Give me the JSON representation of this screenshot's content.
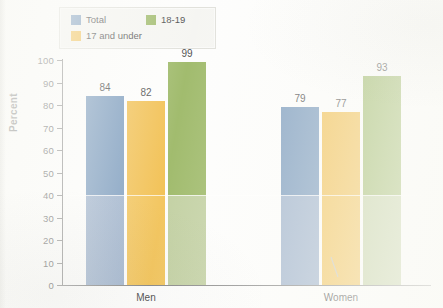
{
  "chart_data": {
    "type": "bar",
    "title": "",
    "xlabel": "",
    "ylabel": "Percent",
    "ylim": [
      0,
      100
    ],
    "ytick_step": 10,
    "yticks": [
      100,
      90,
      80,
      70,
      60,
      50,
      40,
      30,
      20,
      10,
      0
    ],
    "grid": false,
    "legend_position": "top-left",
    "categories": [
      "Men",
      "Women"
    ],
    "series": [
      {
        "name": "Total",
        "color": "#5f86b0",
        "color_lower": "#8ba3c2",
        "values": [
          84,
          79
        ]
      },
      {
        "name": "17 and under",
        "color": "#efb32e",
        "color_lower": "#f0b839",
        "values": [
          82,
          77
        ]
      },
      {
        "name": "18-19",
        "color": "#8aab4a",
        "color_lower": "#b5c68e",
        "values": [
          99,
          93
        ]
      }
    ],
    "value_labels": {
      "Men": [
        "84",
        "82",
        "99"
      ],
      "Women": [
        "79",
        "77",
        "93"
      ]
    }
  },
  "legend": {
    "items": [
      {
        "label": "Total"
      },
      {
        "label": "18-19"
      },
      {
        "label": "17 and under"
      }
    ]
  },
  "axis": {
    "y_label": "Percent",
    "y_ticks": [
      "100",
      "90",
      "80",
      "70",
      "60",
      "50",
      "40",
      "30",
      "20",
      "10",
      "0"
    ],
    "x_categories": [
      "Men",
      "Women"
    ]
  }
}
